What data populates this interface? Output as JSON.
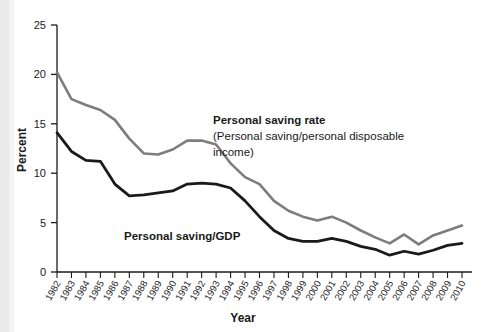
{
  "chart_data": {
    "type": "line",
    "title": "",
    "xlabel": "Year",
    "ylabel": "Percent",
    "ylim": [
      0,
      25
    ],
    "yticks": [
      0,
      5,
      10,
      15,
      20,
      25
    ],
    "grid": false,
    "legend_position": "inline-annotations",
    "categories": [
      "1982",
      "1983",
      "1984",
      "1985",
      "1986",
      "1987",
      "1988",
      "1989",
      "1990",
      "1991",
      "1992",
      "1993",
      "1994",
      "1995",
      "1996",
      "1997",
      "1998",
      "1999",
      "2000",
      "2001",
      "2002",
      "2003",
      "2004",
      "2005",
      "2006",
      "2007",
      "2008",
      "2009",
      "2010"
    ],
    "series": [
      {
        "name": "Personal saving rate",
        "sublabel": "(Personal saving/personal disposable income)",
        "color": "#7d7d7d",
        "values": [
          20.2,
          17.5,
          16.9,
          16.4,
          15.4,
          13.5,
          12.0,
          11.9,
          12.4,
          13.3,
          13.3,
          12.9,
          11.0,
          9.6,
          8.9,
          7.2,
          6.2,
          5.6,
          5.2,
          5.6,
          5.0,
          4.2,
          3.5,
          2.9,
          3.8,
          2.8,
          3.7,
          4.2,
          4.7
        ]
      },
      {
        "name": "Personal saving/GDP",
        "color": "#1a1a1a",
        "values": [
          14.1,
          12.2,
          11.3,
          11.2,
          8.9,
          7.7,
          7.8,
          8.0,
          8.2,
          8.9,
          9.0,
          8.9,
          8.5,
          7.2,
          5.6,
          4.2,
          3.4,
          3.1,
          3.1,
          3.4,
          3.1,
          2.6,
          2.3,
          1.7,
          2.1,
          1.8,
          2.2,
          2.7,
          2.9
        ]
      }
    ],
    "annotations": [
      {
        "name": "personal-saving-rate-annotation",
        "line1": "Personal saving rate",
        "line2": "(Personal saving/personal disposable",
        "line3": "income)"
      },
      {
        "name": "personal-saving-gdp-annotation",
        "line1": "Personal saving/GDP"
      }
    ]
  }
}
